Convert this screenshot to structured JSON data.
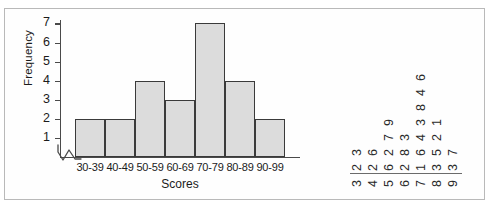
{
  "figure": {
    "background_color": "#ffffff",
    "frame_color": "#b9b9b9"
  },
  "chart_data": {
    "type": "bar",
    "title": "",
    "xlabel": "Scores",
    "ylabel": "Frequency",
    "categories": [
      "30-39",
      "40-49",
      "50-59",
      "60-69",
      "70-79",
      "80-89",
      "90-99"
    ],
    "values": [
      2,
      2,
      4,
      3,
      7,
      4,
      2
    ],
    "ylim": [
      0,
      7
    ],
    "yticks": [
      1,
      2,
      3,
      4,
      5,
      6,
      7
    ],
    "grid": false,
    "legend": null,
    "axis_break_on_y_origin": true,
    "bar_fill_color": "#dcdcdc",
    "bar_edge_color": "#3a3a3a"
  },
  "stem_leaf": {
    "orientation": "rotated-90-ccw",
    "stem_label": "",
    "leaf_label": "",
    "rows": [
      {
        "stem": "3",
        "leaves": [
          "2",
          "3"
        ]
      },
      {
        "stem": "4",
        "leaves": [
          "2",
          "6"
        ]
      },
      {
        "stem": "5",
        "leaves": [
          "6",
          "2",
          "7",
          "9"
        ]
      },
      {
        "stem": "6",
        "leaves": [
          "2",
          "8",
          "3"
        ]
      },
      {
        "stem": "7",
        "leaves": [
          "1",
          "6",
          "4",
          "3",
          "8",
          "4",
          "6"
        ]
      },
      {
        "stem": "8",
        "leaves": [
          "3",
          "5",
          "2",
          "1"
        ]
      },
      {
        "stem": "9",
        "leaves": [
          "3",
          "7"
        ]
      }
    ]
  }
}
